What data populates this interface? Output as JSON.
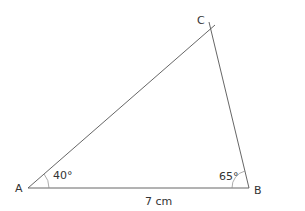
{
  "diagram": {
    "type": "triangle",
    "vertices": {
      "A": {
        "label": "A",
        "x": 28,
        "y": 188
      },
      "B": {
        "label": "B",
        "x": 249,
        "y": 188
      },
      "C": {
        "label": "C",
        "x": 211,
        "y": 28
      }
    },
    "angles": {
      "A": "40°",
      "B": "65°"
    },
    "sides": {
      "AB": "7 cm"
    },
    "colors": {
      "line": "#555555",
      "text": "#333333"
    }
  }
}
